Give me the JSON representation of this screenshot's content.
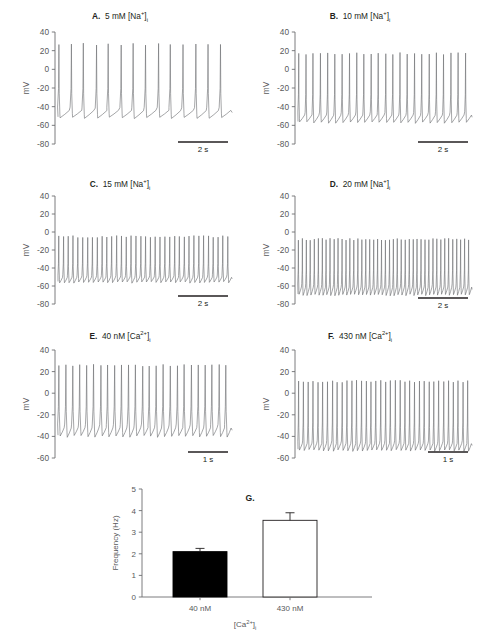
{
  "figure": {
    "ylabel_mv": "mV",
    "panels": [
      {
        "id": "A",
        "label": "A.",
        "title_text": "5 mM [Na+]i",
        "title_html": "5 mM [Na<sup>+</sup>]<sub>i</sub>",
        "ylabel": "mV",
        "yticks": [
          40,
          20,
          0,
          -20,
          -40,
          -60,
          -80
        ],
        "ymin": -80,
        "ymax": 40,
        "scalebar_label": "2 s",
        "spike_count": 14,
        "peak_mv": 27,
        "trough_mv": -52,
        "threshold_mv": -41,
        "ramp_start_mv": -52,
        "duty": 0.16
      },
      {
        "id": "B",
        "label": "B.",
        "title_text": "10 mM [Na+]i",
        "title_html": "10 mM [Na<sup>+</sup>]<sub>i</sub>",
        "ylabel": "mV",
        "yticks": [
          40,
          20,
          0,
          -20,
          -40,
          -60,
          -80
        ],
        "ymin": -80,
        "ymax": 40,
        "scalebar_label": "2 s",
        "spike_count": 24,
        "peak_mv": 17,
        "trough_mv": -57,
        "threshold_mv": -46,
        "ramp_start_mv": -57,
        "duty": 0.2
      },
      {
        "id": "C",
        "label": "C.",
        "title_text": "15 mM [Na+]i",
        "title_html": "15 mM [Na<sup>+</sup>]<sub>i</sub>",
        "ylabel": "mV",
        "yticks": [
          40,
          20,
          0,
          -20,
          -40,
          -60,
          -80
        ],
        "ymin": -80,
        "ymax": 40,
        "scalebar_label": "2 s",
        "spike_count": 36,
        "peak_mv": -5,
        "trough_mv": -56,
        "threshold_mv": -48,
        "ramp_start_mv": -56,
        "duty": 0.3
      },
      {
        "id": "D",
        "label": "D.",
        "title_text": "20 mM [Na+]i",
        "title_html": "20 mM [Na<sup>+</sup>]<sub>i</sub>",
        "ylabel": "mV",
        "yticks": [
          40,
          20,
          0,
          -20,
          -40,
          -60,
          -80
        ],
        "ymin": -80,
        "ymax": 40,
        "scalebar_label": "2 s",
        "spike_count": 44,
        "peak_mv": -8,
        "trough_mv": -70,
        "threshold_mv": -58,
        "ramp_start_mv": -70,
        "duty": 0.3
      },
      {
        "id": "E",
        "label": "E.",
        "title_text": "40 nM [Ca2+]i",
        "title_html": "40 nM [Ca<sup>2+</sup>]<sub>i</sub>",
        "ylabel": "mV",
        "yticks": [
          40,
          20,
          0,
          -20,
          -40,
          -60
        ],
        "ymin": -60,
        "ymax": 40,
        "scalebar_label": "1 s",
        "spike_count": 25,
        "peak_mv": 26,
        "trough_mv": -40,
        "threshold_mv": -29,
        "ramp_start_mv": -40,
        "duty": 0.33
      },
      {
        "id": "F",
        "label": "F.",
        "title_text": "430 nM [Ca2+]i",
        "title_html": "430 nM [Ca<sup>2+</sup>]<sub>i</sub>",
        "ylabel": "mV",
        "yticks": [
          40,
          20,
          0,
          -20,
          -40,
          -60
        ],
        "ymin": -60,
        "ymax": 40,
        "scalebar_label": "1 s",
        "spike_count": 36,
        "peak_mv": 11,
        "trough_mv": -53,
        "threshold_mv": -44,
        "ramp_start_mv": -53,
        "duty": 0.3
      }
    ]
  },
  "chart_data": {
    "type": "bar",
    "panel_label": "G.",
    "title": "G.",
    "categories": [
      "40 nM",
      "430 nM"
    ],
    "values": [
      2.1,
      3.55
    ],
    "errors": [
      0.15,
      0.35
    ],
    "bar_styles": [
      "filled",
      "open"
    ],
    "xlabel": "[Ca2+]i",
    "xlabel_html": "[Ca<sup>2+</sup>]<sub>i</sub>",
    "ylabel": "Frequency (Hz)",
    "yticks": [
      0,
      1,
      2,
      3,
      4,
      5
    ],
    "ylim": [
      0,
      5
    ],
    "grid": false,
    "legend": "none"
  }
}
